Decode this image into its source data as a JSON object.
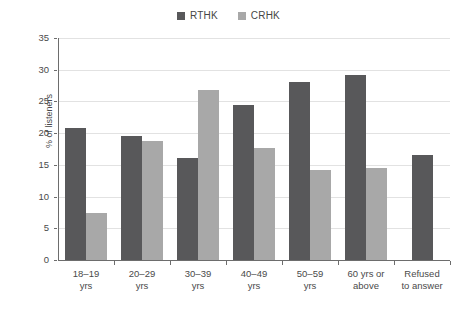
{
  "chart_data": {
    "type": "bar",
    "title": "",
    "subtitle": "",
    "xlabel": "",
    "ylabel": "% of listeners",
    "ylim": [
      0,
      35
    ],
    "ytick_step": 5,
    "yticks": [
      0,
      5,
      10,
      15,
      20,
      25,
      30,
      35
    ],
    "grid": "horizontal",
    "legend_position": "top-center",
    "categories": [
      "18–19\nyrs",
      "20–29\nyrs",
      "30–39\nyrs",
      "40–49\nyrs",
      "50–59\nyrs",
      "60 yrs or\nabove",
      "Refused\nto answer"
    ],
    "series": [
      {
        "name": "RTHK",
        "color": "#58585a",
        "values": [
          20.8,
          19.5,
          16.1,
          24.5,
          28.0,
          29.1,
          16.6
        ]
      },
      {
        "name": "CRHK",
        "color": "#a8a8a8",
        "values": [
          7.4,
          18.8,
          26.8,
          17.6,
          14.2,
          14.5,
          null
        ]
      }
    ]
  },
  "axis_colors": {
    "axis_line": "#6d6d6d",
    "gridline": "#e2e2e2",
    "text": "#4a4a4a",
    "background": "#ffffff"
  }
}
